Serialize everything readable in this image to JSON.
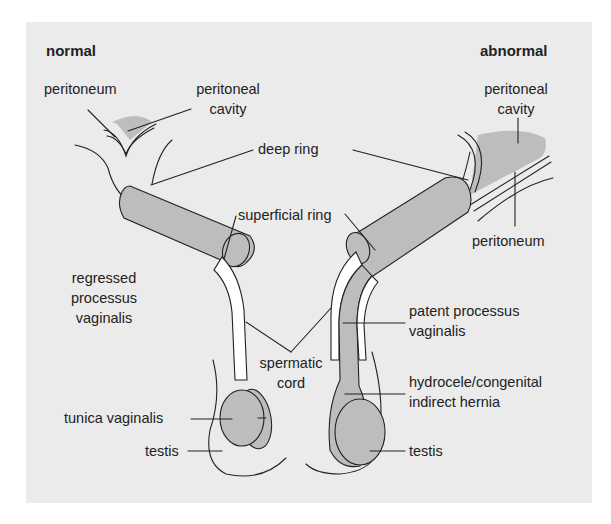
{
  "figure": {
    "type": "anatomical-diagram",
    "colors": {
      "background": "#ebebeb",
      "fill": "#bdbdbd",
      "line": "#222222",
      "white": "#ffffff"
    },
    "panels": {
      "normal": {
        "title": "normal",
        "labels": {
          "peritoneum": "peritoneum",
          "peritoneal_cavity_1": "peritoneal",
          "peritoneal_cavity_2": "cavity",
          "regressed_1": "regressed",
          "regressed_2": "processus",
          "regressed_3": "vaginalis",
          "tunica_vaginalis": "tunica vaginalis",
          "testis": "testis"
        }
      },
      "abnormal": {
        "title": "abnormal",
        "labels": {
          "peritoneal_cavity_1": "peritoneal",
          "peritoneal_cavity_2": "cavity",
          "peritoneum": "peritoneum",
          "patent_1": "patent processus",
          "patent_2": "vaginalis",
          "hydrocele_1": "hydrocele/congenital",
          "hydrocele_2": "indirect hernia",
          "testis": "testis"
        }
      }
    },
    "shared_labels": {
      "deep_ring": "deep ring",
      "superficial_ring": "superficial ring",
      "spermatic_1": "spermatic",
      "spermatic_2": "cord"
    }
  }
}
